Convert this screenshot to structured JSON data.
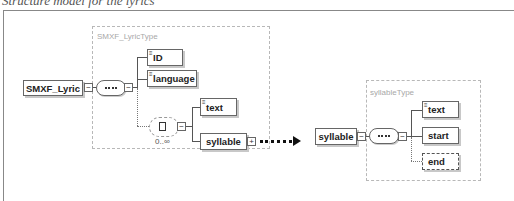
{
  "caption": "Structure model for the lyrics",
  "lyric_type": {
    "label": "SMXF_LyricType",
    "root": "SMXF_Lyric",
    "children": [
      "ID",
      "language"
    ],
    "choice": {
      "cardinality": "0..∞",
      "options": [
        "text",
        "syllable"
      ]
    }
  },
  "syllable_type": {
    "label": "syllableType",
    "root": "syllable",
    "children": [
      "text",
      "start",
      "end"
    ]
  },
  "icons": {
    "collapse": "−",
    "expand": "+"
  },
  "colors": {
    "border": "#666666",
    "dashed": "#b8b8b8",
    "arrow": "#111111"
  }
}
